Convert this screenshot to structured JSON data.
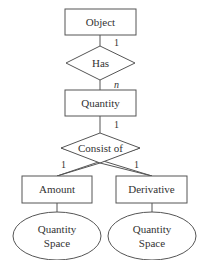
{
  "diagram": {
    "type": "er-diagram",
    "colors": {
      "stroke": "#555555",
      "text": "#333333",
      "background": "#ffffff"
    },
    "entities": [
      {
        "id": "object",
        "label": "Object"
      },
      {
        "id": "quantity",
        "label": "Quantity"
      },
      {
        "id": "amount",
        "label": "Amount"
      },
      {
        "id": "derivative",
        "label": "Derivative"
      }
    ],
    "relationships": [
      {
        "id": "has",
        "label": "Has"
      },
      {
        "id": "consist_of",
        "label": "Consist of"
      }
    ],
    "attributes": [
      {
        "id": "amount_qs",
        "label_line1": "Quantity",
        "label_line2": "Space",
        "of": "amount"
      },
      {
        "id": "derivative_qs",
        "label_line1": "Quantity",
        "label_line2": "Space",
        "of": "derivative"
      }
    ],
    "cardinalities": {
      "object_has": "1",
      "has_quantity": "n",
      "quantity_consist": "1",
      "consist_amount": "1",
      "consist_derivative": "1"
    }
  }
}
